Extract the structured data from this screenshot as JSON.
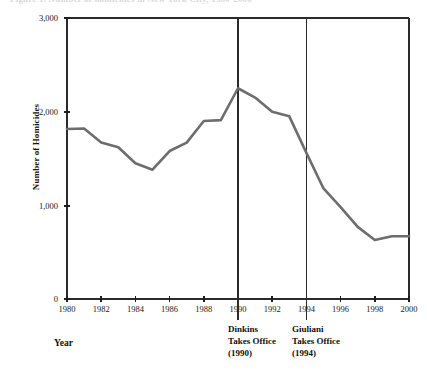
{
  "figure": {
    "caption_sliver": "Figure 1. Number of homicides in New York City, 1980-2000"
  },
  "axis": {
    "y_title": "Number of Homicides",
    "x_title": "Year",
    "y_ticks": [
      "0",
      "1,000",
      "2,000",
      "3,000"
    ],
    "x_ticks": [
      "1980",
      "1982",
      "1984",
      "1986",
      "1988",
      "1990",
      "1992",
      "1994",
      "1996",
      "1998",
      "2000"
    ]
  },
  "annotations": {
    "dinkins": {
      "line1": "Dinkins",
      "line2": "Takes Office",
      "line3": "(1990)",
      "year": 1990
    },
    "giuliani": {
      "line1": "Giuliani",
      "line2": "Takes Office",
      "line3": "(1994)",
      "year": 1994
    }
  },
  "colors": {
    "line": "#6d6d6d",
    "axis": "#2b2b2b",
    "text": "#111111",
    "background": "#ffffff"
  },
  "chart_data": {
    "type": "line",
    "title": "",
    "xlabel": "Year",
    "ylabel": "Number of Homicides",
    "xlim": [
      1980,
      2000
    ],
    "ylim": [
      0,
      3000
    ],
    "ytick_values": [
      0,
      1000,
      2000,
      3000
    ],
    "xtick_values": [
      1980,
      1982,
      1984,
      1986,
      1988,
      1990,
      1992,
      1994,
      1996,
      1998,
      2000
    ],
    "grid": false,
    "legend": false,
    "x": [
      1980,
      1981,
      1982,
      1983,
      1984,
      1985,
      1986,
      1987,
      1988,
      1989,
      1990,
      1991,
      1992,
      1993,
      1994,
      1995,
      1996,
      1997,
      1998,
      1999,
      2000
    ],
    "series": [
      {
        "name": "Homicides",
        "values": [
          1815,
          1820,
          1670,
          1620,
          1450,
          1380,
          1580,
          1670,
          1900,
          1910,
          2250,
          2150,
          2000,
          1950,
          1560,
          1180,
          980,
          770,
          630,
          670,
          670
        ]
      }
    ],
    "annotations": [
      {
        "x": 1990,
        "label": "Dinkins Takes Office (1990)",
        "type": "vline"
      },
      {
        "x": 1994,
        "label": "Giuliani Takes Office (1994)",
        "type": "vline"
      }
    ]
  }
}
